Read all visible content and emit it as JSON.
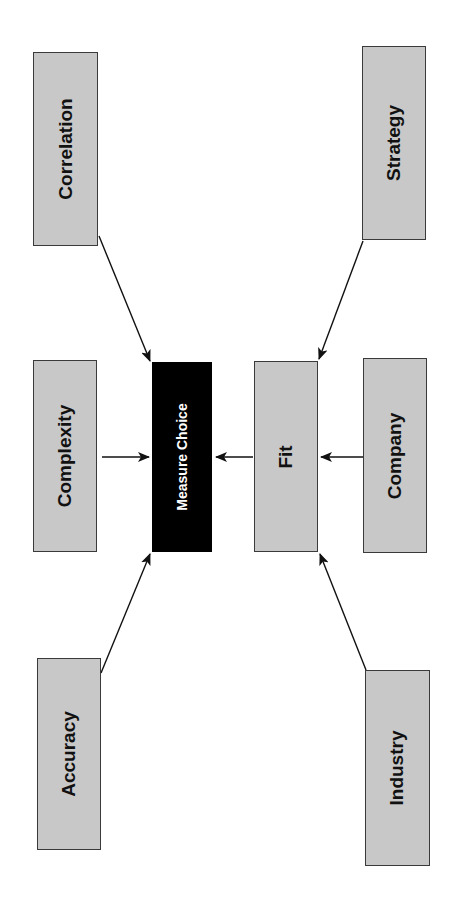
{
  "diagram": {
    "orientation": "rotated-90-ccw",
    "colors": {
      "factor_box": "#c8c8c8",
      "central_box": "#000000",
      "central_text": "#ffffff",
      "border": "#3a3a3a",
      "arrow": "#111111"
    },
    "nodes": {
      "correlation": {
        "label": "Correlation"
      },
      "complexity": {
        "label": "Complexity"
      },
      "accuracy": {
        "label": "Accuracy"
      },
      "measure_choice": {
        "label": "Measure Choice"
      },
      "fit": {
        "label": "Fit"
      },
      "strategy": {
        "label": "Strategy"
      },
      "company": {
        "label": "Company"
      },
      "industry": {
        "label": "Industry"
      }
    },
    "edges": [
      {
        "from": "Correlation",
        "to": "Measure Choice"
      },
      {
        "from": "Complexity",
        "to": "Measure Choice"
      },
      {
        "from": "Accuracy",
        "to": "Measure Choice"
      },
      {
        "from": "Fit",
        "to": "Measure Choice"
      },
      {
        "from": "Strategy",
        "to": "Fit"
      },
      {
        "from": "Company",
        "to": "Fit"
      },
      {
        "from": "Industry",
        "to": "Fit"
      }
    ]
  }
}
